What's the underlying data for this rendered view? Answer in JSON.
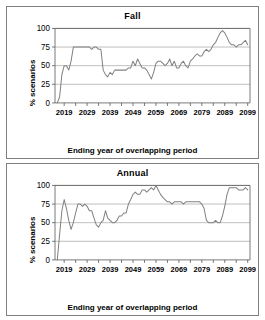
{
  "figure": {
    "panels": [
      "fall",
      "annual"
    ]
  },
  "chart_data": [
    {
      "id": "fall",
      "type": "line",
      "title": "Fall",
      "xlabel": "Ending year of overlapping period",
      "ylabel": "% scenarios",
      "xlim": [
        2015,
        2100
      ],
      "ylim": [
        0,
        100
      ],
      "xticks": [
        2019,
        2029,
        2039,
        2049,
        2059,
        2069,
        2079,
        2089,
        2099
      ],
      "yticks": [
        0,
        25,
        50,
        75,
        100
      ],
      "grid": true,
      "legend": "none",
      "line_color": "#808080",
      "x": [
        2016,
        2017,
        2018,
        2019,
        2020,
        2021,
        2022,
        2023,
        2024,
        2025,
        2026,
        2027,
        2028,
        2029,
        2030,
        2031,
        2032,
        2033,
        2034,
        2035,
        2036,
        2037,
        2038,
        2039,
        2040,
        2041,
        2042,
        2043,
        2044,
        2045,
        2046,
        2047,
        2048,
        2049,
        2050,
        2051,
        2052,
        2053,
        2054,
        2055,
        2056,
        2057,
        2058,
        2059,
        2060,
        2061,
        2062,
        2063,
        2064,
        2065,
        2066,
        2067,
        2068,
        2069,
        2070,
        2071,
        2072,
        2073,
        2074,
        2075,
        2076,
        2077,
        2078,
        2079,
        2080,
        2081,
        2082,
        2083,
        2084,
        2085,
        2086,
        2087,
        2088,
        2089,
        2090,
        2091,
        2092,
        2093,
        2094,
        2095,
        2096,
        2097,
        2098,
        2099
      ],
      "values": [
        0,
        8,
        38,
        50,
        50,
        44,
        56,
        75,
        75,
        75,
        75,
        75,
        75,
        75,
        75,
        72,
        75,
        75,
        72,
        72,
        44,
        38,
        35,
        41,
        38,
        44,
        44,
        44,
        44,
        44,
        44,
        47,
        47,
        56,
        50,
        59,
        53,
        47,
        47,
        44,
        38,
        32,
        41,
        53,
        56,
        56,
        53,
        50,
        53,
        59,
        50,
        56,
        47,
        47,
        53,
        56,
        50,
        47,
        56,
        59,
        63,
        66,
        63,
        63,
        69,
        72,
        69,
        72,
        78,
        81,
        88,
        94,
        97,
        94,
        88,
        81,
        78,
        78,
        75,
        78,
        78,
        81,
        84,
        78
      ]
    },
    {
      "id": "annual",
      "type": "line",
      "title": "Annual",
      "xlabel": "Ending year of overlapping period",
      "ylabel": "% scenarios",
      "xlim": [
        2015,
        2100
      ],
      "ylim": [
        0,
        100
      ],
      "xticks": [
        2019,
        2029,
        2039,
        2049,
        2059,
        2069,
        2079,
        2089,
        2099
      ],
      "yticks": [
        0,
        25,
        50,
        75,
        100
      ],
      "grid": true,
      "legend": "none",
      "line_color": "#808080",
      "x": [
        2016,
        2017,
        2018,
        2019,
        2020,
        2021,
        2022,
        2023,
        2024,
        2025,
        2026,
        2027,
        2028,
        2029,
        2030,
        2031,
        2032,
        2033,
        2034,
        2035,
        2036,
        2037,
        2038,
        2039,
        2040,
        2041,
        2042,
        2043,
        2044,
        2045,
        2046,
        2047,
        2048,
        2049,
        2050,
        2051,
        2052,
        2053,
        2054,
        2055,
        2056,
        2057,
        2058,
        2059,
        2060,
        2061,
        2062,
        2063,
        2064,
        2065,
        2066,
        2067,
        2068,
        2069,
        2070,
        2071,
        2072,
        2073,
        2074,
        2075,
        2076,
        2077,
        2078,
        2079,
        2080,
        2081,
        2082,
        2083,
        2084,
        2085,
        2086,
        2087,
        2088,
        2089,
        2090,
        2091,
        2092,
        2093,
        2094,
        2095,
        2096,
        2097,
        2098,
        2099
      ],
      "values": [
        0,
        34,
        66,
        81,
        69,
        53,
        41,
        50,
        63,
        75,
        75,
        72,
        75,
        72,
        66,
        66,
        56,
        47,
        44,
        50,
        53,
        66,
        56,
        53,
        50,
        50,
        53,
        59,
        59,
        63,
        63,
        75,
        81,
        88,
        91,
        88,
        88,
        94,
        94,
        91,
        94,
        97,
        94,
        100,
        94,
        88,
        84,
        81,
        78,
        78,
        75,
        78,
        78,
        78,
        78,
        75,
        78,
        78,
        78,
        78,
        78,
        78,
        78,
        75,
        69,
        53,
        50,
        50,
        50,
        53,
        50,
        50,
        59,
        72,
        88,
        97,
        97,
        97,
        97,
        94,
        94,
        94,
        97,
        94
      ]
    }
  ]
}
